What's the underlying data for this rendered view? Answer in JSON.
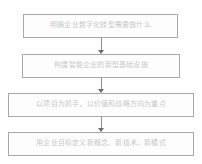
{
  "diagram": {
    "orientation": "vertical",
    "nodes": [
      {
        "id": "step-1",
        "label": "明确企业数字化转型需要做什么"
      },
      {
        "id": "step-2",
        "label": "构建智能企业的新型基础设施"
      },
      {
        "id": "step-3",
        "label": "以项目为抓手，以价值和战略方向为重点"
      },
      {
        "id": "step-4",
        "label": "用企业目标定义新概念、新技术、新模式"
      }
    ],
    "connectors": [
      {
        "id": "arrow-1",
        "from": "step-1",
        "to": "step-2",
        "glyph": "arrow-down-icon"
      },
      {
        "id": "arrow-2",
        "from": "step-2",
        "to": "step-3",
        "glyph": "arrow-down-icon"
      },
      {
        "id": "arrow-3",
        "from": "step-3",
        "to": "step-4",
        "glyph": "arrow-down-icon"
      }
    ],
    "colors": {
      "background": "#fefefe",
      "node_border": "#a8a8a8",
      "node_fill": "#fdfdfd",
      "node_text": "#c9c9c9",
      "connector": "#8f8f8f",
      "arrowhead": "#6d6d6d"
    }
  }
}
